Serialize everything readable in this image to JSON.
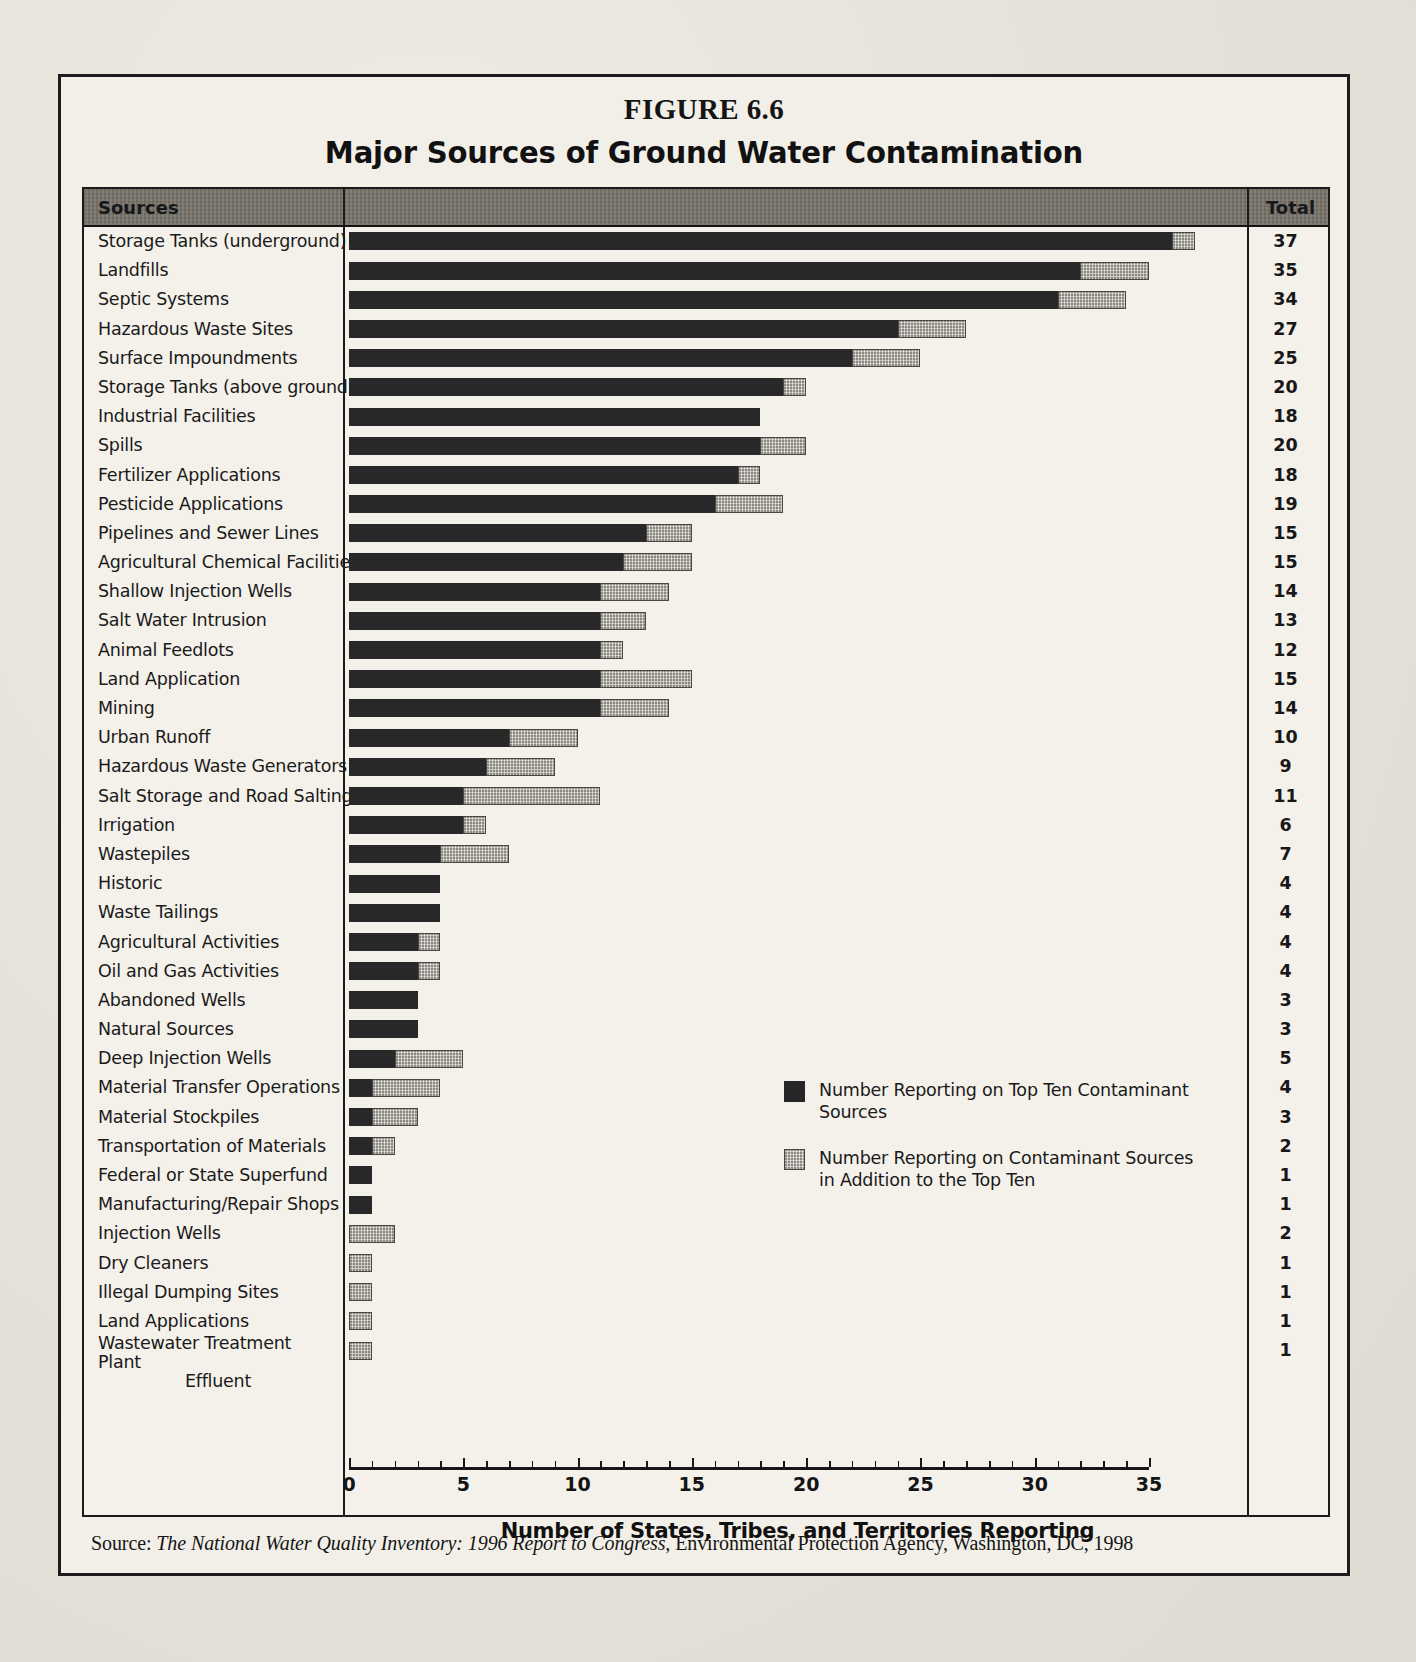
{
  "figure": {
    "number": "FIGURE 6.6",
    "title": "Major Sources of Ground Water Contamination"
  },
  "table": {
    "header_sources": "Sources",
    "header_total": "Total"
  },
  "legend": {
    "items": [
      {
        "swatch": "dark-square-icon",
        "label": "Number Reporting on Top Ten Contaminant Sources"
      },
      {
        "swatch": "hatched-square-icon",
        "label": "Number Reporting on Contaminant Sources in Addition to the Top Ten"
      }
    ]
  },
  "axis": {
    "title": "Number of States, Tribes, and Territories Reporting",
    "ticks": [
      "0",
      "5",
      "10",
      "15",
      "20",
      "25",
      "30",
      "35"
    ],
    "min": 0,
    "max": 35
  },
  "source": {
    "prefix": "Source: ",
    "italic": "The National Water Quality Inventory: 1996 Report to Congress",
    "rest": ", Environmental Protection Agency, Washington, DC, 1998"
  },
  "chart_data": {
    "type": "bar",
    "orientation": "horizontal",
    "stacked": true,
    "title": "Major Sources of Ground Water Contamination",
    "subtitle": "FIGURE 6.6",
    "xlabel": "Number of States, Tribes, and Territories Reporting",
    "ylabel": "Sources",
    "xlim": [
      0,
      35
    ],
    "xticks": [
      0,
      5,
      10,
      15,
      20,
      25,
      30,
      35
    ],
    "grid": false,
    "legend_position": "inside-right",
    "categories": [
      "Storage Tanks (underground)",
      "Landfills",
      "Septic Systems",
      "Hazardous Waste Sites",
      "Surface Impoundments",
      "Storage Tanks (above ground)",
      "Industrial Facilities",
      "Spills",
      "Fertilizer Applications",
      "Pesticide Applications",
      "Pipelines and Sewer Lines",
      "Agricultural Chemical Facilities",
      "Shallow Injection Wells",
      "Salt Water Intrusion",
      "Animal Feedlots",
      "Land Application",
      "Mining",
      "Urban Runoff",
      "Hazardous Waste Generators",
      "Salt Storage and Road Salting",
      "Irrigation",
      "Wastepiles",
      "Historic",
      "Waste Tailings",
      "Agricultural Activities",
      "Oil and Gas Activities",
      "Abandoned Wells",
      "Natural Sources",
      "Deep Injection Wells",
      "Material Transfer Operations",
      "Material Stockpiles",
      "Transportation of Materials",
      "Federal or State Superfund",
      "Manufacturing/Repair Shops",
      "Injection Wells",
      "Dry Cleaners",
      "Illegal Dumping Sites",
      "Land Applications",
      "Wastewater Treatment Plant Effluent"
    ],
    "series": [
      {
        "name": "Number Reporting on Top Ten Contaminant Sources",
        "values": [
          36,
          32,
          31,
          24,
          22,
          19,
          18,
          18,
          17,
          16,
          13,
          12,
          11,
          11,
          11,
          11,
          11,
          7,
          6,
          5,
          5,
          4,
          4,
          4,
          3,
          3,
          3,
          3,
          2,
          1,
          1,
          1,
          1,
          1,
          0,
          0,
          0,
          0,
          0
        ]
      },
      {
        "name": "Number Reporting on Contaminant Sources in Addition to the Top Ten",
        "values": [
          1,
          3,
          3,
          3,
          3,
          1,
          0,
          2,
          1,
          3,
          2,
          3,
          3,
          2,
          1,
          4,
          3,
          3,
          3,
          6,
          1,
          3,
          0,
          0,
          1,
          1,
          0,
          0,
          3,
          3,
          2,
          1,
          0,
          0,
          2,
          1,
          1,
          1,
          1
        ]
      }
    ],
    "totals": [
      37,
      35,
      34,
      27,
      25,
      20,
      18,
      20,
      18,
      19,
      15,
      15,
      14,
      13,
      12,
      15,
      14,
      10,
      9,
      11,
      6,
      7,
      4,
      4,
      4,
      4,
      3,
      3,
      5,
      4,
      3,
      2,
      1,
      1,
      2,
      1,
      1,
      1,
      1
    ]
  }
}
